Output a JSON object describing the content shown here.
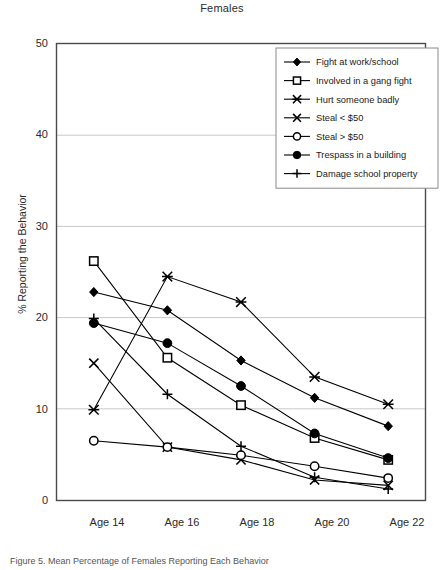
{
  "chart_data": {
    "type": "line",
    "title": "Females",
    "xlabel": "",
    "ylabel": "% Reporting the Behavior",
    "categories": [
      "Age 14",
      "Age 16",
      "Age 18",
      "Age 20",
      "Age 22"
    ],
    "ylim": [
      0,
      50
    ],
    "yticks": [
      0,
      10,
      20,
      30,
      40,
      50
    ],
    "grid": true,
    "legend_position": "top-right",
    "series": [
      {
        "name": "Fight at work/school",
        "marker": "filled-diamond",
        "values": [
          22.8,
          20.8,
          15.3,
          11.2,
          8.1
        ]
      },
      {
        "name": "Involved in a gang fight",
        "marker": "open-square",
        "values": [
          26.2,
          15.6,
          10.4,
          6.8,
          4.4
        ]
      },
      {
        "name": "Hurt someone badly",
        "marker": "asterisk",
        "values": [
          9.9,
          24.5,
          21.7,
          13.5,
          10.5
        ]
      },
      {
        "name": "Steal < $50",
        "marker": "cross-x",
        "values": [
          15.0,
          5.8,
          4.4,
          2.2,
          1.6
        ]
      },
      {
        "name": "Steal > $50",
        "marker": "open-circle",
        "values": [
          6.5,
          5.8,
          4.9,
          3.7,
          2.4
        ]
      },
      {
        "name": "Trespass in a building",
        "marker": "filled-circle",
        "values": [
          19.4,
          17.2,
          12.5,
          7.3,
          4.6
        ]
      },
      {
        "name": "Damage school property",
        "marker": "plus",
        "values": [
          19.9,
          11.6,
          5.9,
          2.5,
          1.2
        ]
      }
    ]
  },
  "caption": "Figure 5. Mean Percentage of Females Reporting Each Behavior"
}
